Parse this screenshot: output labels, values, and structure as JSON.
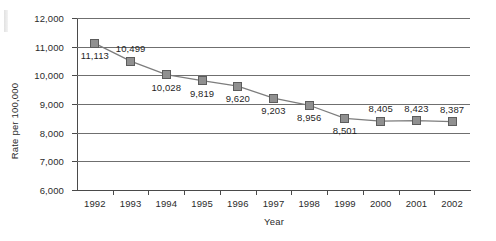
{
  "chart_data": {
    "type": "line",
    "title": "",
    "subtitle": "",
    "xlabel": "Year",
    "ylabel": "Rate per 100,000",
    "categories": [
      "1992",
      "1993",
      "1994",
      "1995",
      "1996",
      "1997",
      "1998",
      "1999",
      "2000",
      "2001",
      "2002"
    ],
    "values": [
      11113,
      10499,
      10028,
      9819,
      9620,
      9203,
      8956,
      8501,
      8405,
      8423,
      8387
    ],
    "data_labels": [
      "11,113",
      "10,499",
      "10,028",
      "9,819",
      "9,620",
      "9,203",
      "8,956",
      "8,501",
      "8,405",
      "8,423",
      "8,387"
    ],
    "label_positions": [
      "below",
      "above",
      "below",
      "below",
      "below",
      "below",
      "below",
      "below",
      "above",
      "above",
      "above"
    ],
    "ylim": [
      6000,
      12000
    ],
    "ytick_values": [
      12000,
      11000,
      10000,
      9000,
      8000,
      7000,
      6000
    ],
    "ytick_labels": [
      "12,000",
      "11,000",
      "10,000",
      "9,000",
      "8,000",
      "7,000",
      "6,000"
    ],
    "grid": "horizontal",
    "legend": "none",
    "series": [
      {
        "name": "Rate per 100,000",
        "values": [
          11113,
          10499,
          10028,
          9819,
          9620,
          9203,
          8956,
          8501,
          8405,
          8423,
          8387
        ]
      }
    ],
    "colors": {
      "line": "#7d7d7d",
      "marker_fill": "#909090",
      "marker_edge": "#5c5c5c",
      "gridline": "#6f6f6f",
      "axis": "#4a4a4a",
      "text": "#2b2b2b",
      "background": "#ffffff"
    }
  }
}
